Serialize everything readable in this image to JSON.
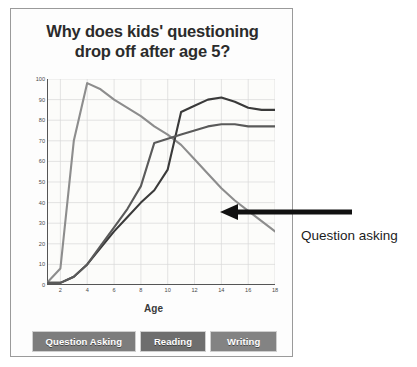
{
  "card": {
    "title_line1": "Why does kids' questioning",
    "title_line2": "drop off after age 5?"
  },
  "annotation": {
    "label": "Question asking",
    "arrow": "left-arrow-icon"
  },
  "legend": {
    "items": [
      {
        "label": "Question Asking",
        "color": "#7d7d7d"
      },
      {
        "label": "Reading",
        "color": "#6e6e6e"
      },
      {
        "label": "Writing",
        "color": "#838383"
      }
    ]
  },
  "chart_data": {
    "type": "line",
    "title": "Why does kids' questioning drop off after age 5?",
    "xlabel": "Age",
    "ylabel": "Percentage",
    "xlim": [
      1,
      18
    ],
    "ylim": [
      0,
      100
    ],
    "xticks": [
      2,
      4,
      6,
      8,
      10,
      12,
      14,
      16,
      18
    ],
    "yticks": [
      0,
      10,
      20,
      30,
      40,
      50,
      60,
      70,
      80,
      90,
      100
    ],
    "grid": true,
    "legend_position": "bottom",
    "x": [
      1,
      2,
      3,
      4,
      5,
      6,
      7,
      8,
      9,
      10,
      11,
      12,
      13,
      14,
      15,
      16,
      17,
      18
    ],
    "series": [
      {
        "name": "Question Asking",
        "color": "#8d8d8d",
        "values": [
          1,
          8,
          70,
          98,
          95,
          90,
          86,
          82,
          77,
          73,
          68,
          61,
          54,
          47,
          41,
          36,
          31,
          26
        ]
      },
      {
        "name": "Reading",
        "color": "#3a3a3a",
        "values": [
          1,
          1,
          4,
          10,
          18,
          26,
          33,
          40,
          46,
          56,
          84,
          87,
          90,
          91,
          89,
          86,
          85,
          85
        ]
      },
      {
        "name": "Writing",
        "color": "#5a5a5a",
        "values": [
          1,
          1,
          4,
          10,
          19,
          28,
          37,
          48,
          69,
          71,
          73,
          75,
          77,
          78,
          78,
          77,
          77,
          77
        ]
      }
    ],
    "annotation": {
      "text": "Question asking",
      "points_to_series": "Question Asking",
      "points_to_x": 15,
      "points_to_y": 41
    }
  }
}
